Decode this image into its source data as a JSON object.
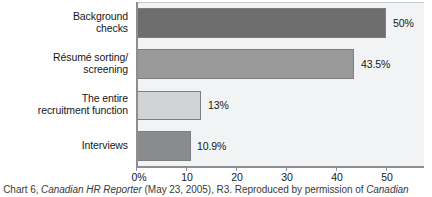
{
  "chart_data": {
    "type": "bar",
    "orientation": "horizontal",
    "title": "",
    "subtitle": "",
    "xlabel": "",
    "ylabel": "",
    "categories": [
      "Background checks",
      "Résumé sorting/ screening",
      "The entire recruitment function",
      "Interviews"
    ],
    "category_lines": [
      [
        "Background",
        "checks"
      ],
      [
        "Résumé sorting/",
        "screening"
      ],
      [
        "The entire",
        "recruitment function"
      ],
      [
        "Interviews"
      ]
    ],
    "values": [
      50,
      43.5,
      13,
      10.9
    ],
    "value_labels": [
      "50%",
      "43.5%",
      "13%",
      "10.9%"
    ],
    "bar_colors": [
      "#6e6e6e",
      "#9a9a9a",
      "#d2d3d4",
      "#8a8b8c"
    ],
    "xlim": [
      0,
      57.6
    ],
    "xticks": [
      0,
      10,
      20,
      30,
      40,
      50
    ],
    "xtick_labels": [
      "0%",
      "10",
      "20",
      "30",
      "40",
      "50"
    ],
    "grid": false,
    "legend": "none",
    "plot_background": "#f2f3f4",
    "axis_color": "#8d8e8f"
  },
  "source": {
    "prefix": "rce: Chart 6, ",
    "italic_one": "Canadian HR Reporter",
    "middle": " (May 23, 2005), R3. Reproduced by permission of ",
    "italic_two": "Canadian",
    "full_text": "rce: Chart 6, Canadian HR Reporter (May 23, 2005), R3. Reproduced by permission of Canadian"
  }
}
